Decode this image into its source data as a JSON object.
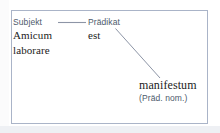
{
  "diagram": {
    "type": "sentence-structure-diagram",
    "border_color": "#aab4c8",
    "background_color": "#ffffff",
    "label_color": "#4d5a6b",
    "text_color": "#1c1c1c",
    "connector_color": "#8d95a6",
    "nodes": {
      "subject": {
        "role_label": "Subjekt",
        "words": [
          "Amicum",
          "laborare"
        ]
      },
      "predicate": {
        "role_label": "Prädikat",
        "words": [
          "est"
        ]
      },
      "predicative": {
        "word": "manifestum",
        "case_note": "(Präd. nom.)"
      }
    },
    "connectors": [
      {
        "name": "subject-predicate-link",
        "from": "Subjekt",
        "to": "Prädikat",
        "style": "horizontal"
      },
      {
        "name": "predicate-predicative-link",
        "from": "est",
        "to": "manifestum",
        "style": "diagonal"
      }
    ]
  }
}
